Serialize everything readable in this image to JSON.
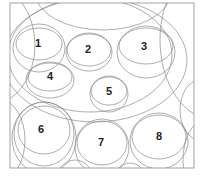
{
  "figure": {
    "frame": {
      "x": 10,
      "y": 3,
      "w": 184,
      "h": 165
    },
    "line_color": "#8a8a8a",
    "background": "#ffffff",
    "labels": [
      {
        "id": "1",
        "text": "1",
        "x": 38,
        "y": 43
      },
      {
        "id": "2",
        "text": "2",
        "x": 88,
        "y": 49
      },
      {
        "id": "3",
        "text": "3",
        "x": 144,
        "y": 46
      },
      {
        "id": "4",
        "text": "4",
        "x": 50,
        "y": 76
      },
      {
        "id": "5",
        "text": "5",
        "x": 109,
        "y": 91
      },
      {
        "id": "6",
        "text": "6",
        "x": 41,
        "y": 129
      },
      {
        "id": "7",
        "text": "7",
        "x": 101,
        "y": 142
      },
      {
        "id": "8",
        "text": "8",
        "x": 159,
        "y": 136
      }
    ]
  }
}
